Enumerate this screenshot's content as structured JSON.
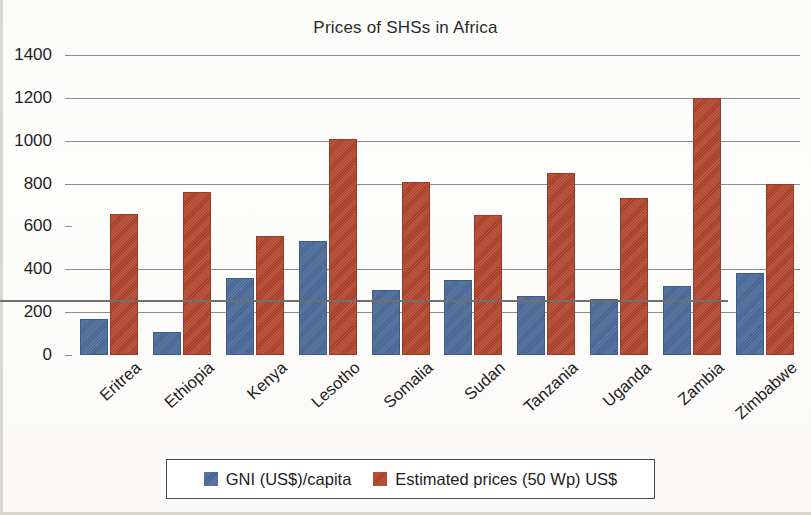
{
  "chart_data": {
    "type": "bar",
    "title": "Prices of SHSs in Africa",
    "xlabel": "",
    "ylabel": "",
    "ylim": [
      0,
      1400
    ],
    "ytick_step": 200,
    "yticks": [
      0,
      200,
      400,
      600,
      800,
      1000,
      1200,
      1400
    ],
    "ytick_labels": [
      "0",
      "200",
      "400",
      "600",
      "800",
      "1000",
      "1200",
      "1400"
    ],
    "grid": true,
    "legend_position": "bottom",
    "categories": [
      "Eritrea",
      "Ethiopia",
      "Kenya",
      "Lesotho",
      "Somalia",
      "Sudan",
      "Tanzania",
      "Uganda",
      "Zambia",
      "Zimbabwe"
    ],
    "series": [
      {
        "name": "GNI (US$)/capita",
        "color": "#4a6a9a",
        "values": [
          160,
          100,
          350,
          525,
          295,
          340,
          265,
          250,
          315,
          375
        ]
      },
      {
        "name": "Estimated prices (50 Wp) US$",
        "color": "#b1432a",
        "values": [
          650,
          750,
          545,
          1000,
          800,
          645,
          840,
          725,
          1190,
          790
        ]
      }
    ]
  },
  "legend": {
    "items": [
      {
        "label": "GNI (US$)/capita",
        "color": "#4a6a9a"
      },
      {
        "label": "Estimated prices (50 Wp) US$",
        "color": "#b1432a"
      }
    ]
  }
}
